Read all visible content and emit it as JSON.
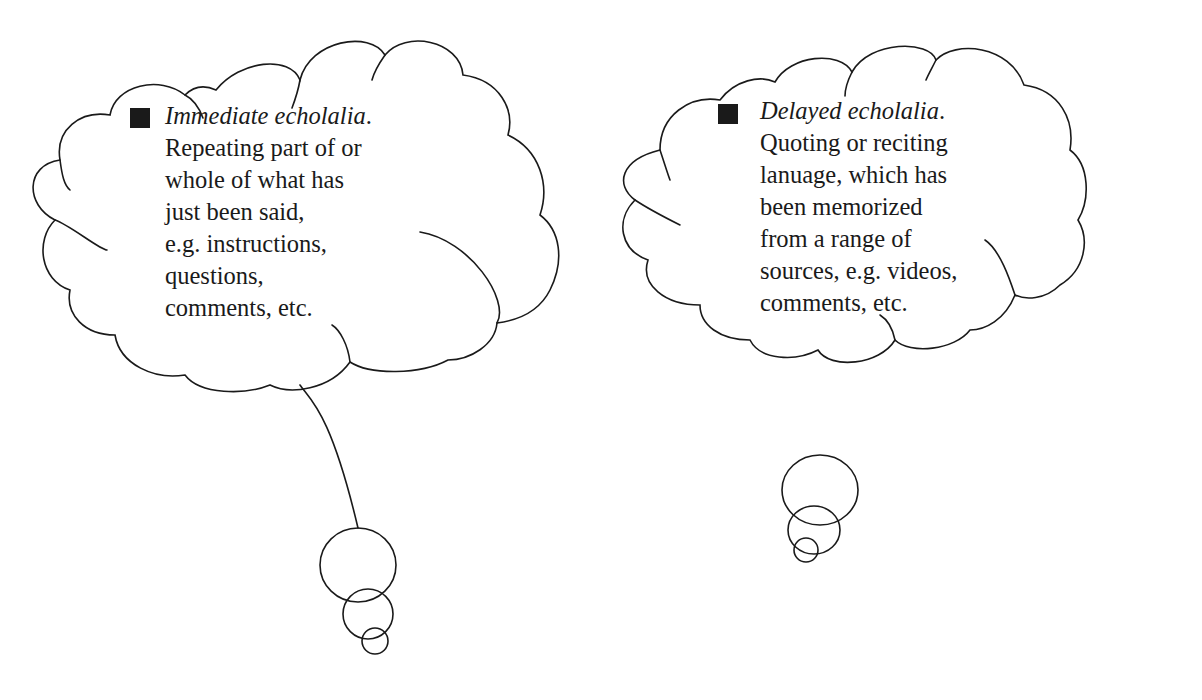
{
  "bubbles": [
    {
      "id": "immediate",
      "heading": "Immediate echolalia",
      "heading_suffix": ".",
      "lines": [
        "Repeating part of or",
        "whole of what has",
        "just been said,",
        "e.g. instructions,",
        "questions,",
        "comments, etc."
      ]
    },
    {
      "id": "delayed",
      "heading": "Delayed echolalia",
      "heading_suffix": ".",
      "lines": [
        "Quoting or reciting",
        "lanuage, which has",
        "been memorized",
        "from a range of",
        "sources, e.g. videos,",
        "comments, etc."
      ]
    }
  ],
  "colors": {
    "stroke": "#1a1a1a",
    "background": "#ffffff",
    "bullet": "#1a1a1a"
  }
}
